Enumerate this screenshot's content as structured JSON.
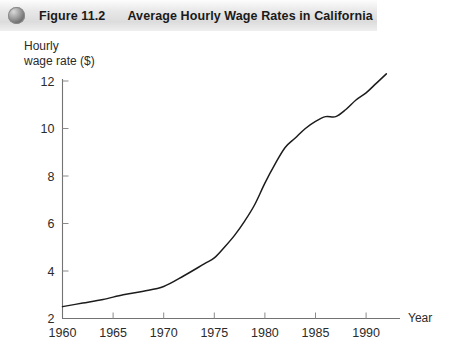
{
  "header": {
    "bullet_icon": "filled-circle-icon",
    "figure_label": "Figure 11.2",
    "title": "Average Hourly Wage Rates in California"
  },
  "chart_data": {
    "type": "line",
    "title": "Average Hourly Wage Rates in California",
    "xlabel": "Year",
    "ylabel": "Hourly wage rate ($)",
    "ylabel_line1": "Hourly",
    "ylabel_line2": "wage rate ($)",
    "xlim": [
      1960,
      1992.5
    ],
    "ylim": [
      2,
      12.6
    ],
    "xticks": [
      1960,
      1965,
      1970,
      1975,
      1980,
      1985,
      1990
    ],
    "xtick_labels": [
      "1960",
      "1965",
      "1970",
      "1975",
      "1980",
      "1985",
      "1990"
    ],
    "yticks": [
      2,
      4,
      6,
      8,
      10,
      12
    ],
    "ytick_labels": [
      "2",
      "4",
      "6",
      "8",
      "10",
      "12"
    ],
    "grid": false,
    "legend": false,
    "line_color": "#1c1c1c",
    "x": [
      1960,
      1962,
      1964,
      1966,
      1968,
      1970,
      1972,
      1974,
      1975,
      1976,
      1977,
      1978,
      1979,
      1980,
      1981,
      1982,
      1983,
      1984,
      1985,
      1986,
      1987,
      1988,
      1989,
      1990,
      1991,
      1992
    ],
    "values": [
      2.5,
      2.65,
      2.8,
      3.0,
      3.15,
      3.35,
      3.8,
      4.3,
      4.55,
      5.0,
      5.5,
      6.1,
      6.8,
      7.7,
      8.5,
      9.2,
      9.6,
      10.0,
      10.3,
      10.5,
      10.5,
      10.8,
      11.2,
      11.5,
      11.9,
      12.3
    ]
  }
}
